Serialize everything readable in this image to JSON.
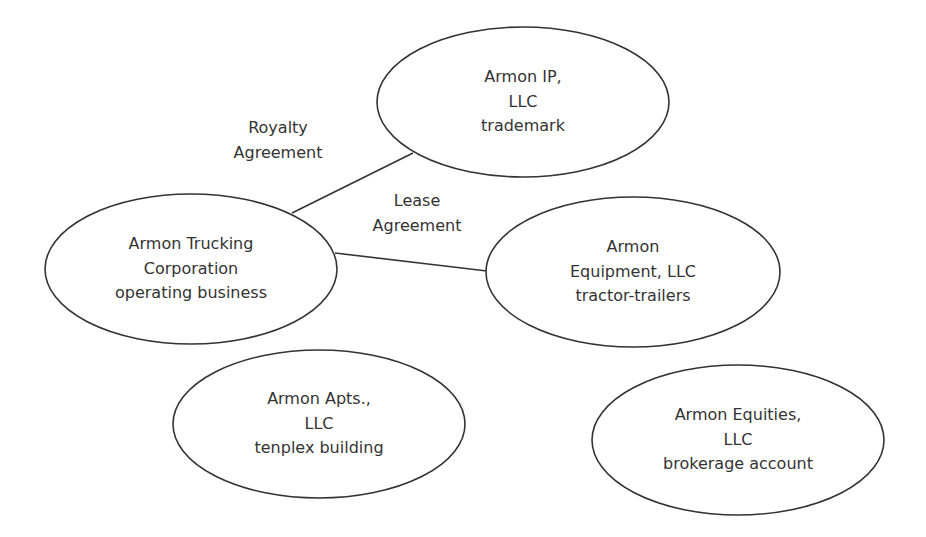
{
  "diagram": {
    "stroke_color": "#333333",
    "text_color": "#333333",
    "background": "#ffffff",
    "nodes": [
      {
        "id": "ip",
        "lines": [
          "Armon IP,",
          "LLC",
          "trademark"
        ],
        "cx": 523,
        "cy": 102,
        "rx": 146,
        "ry": 75
      },
      {
        "id": "trucking",
        "lines": [
          "Armon Trucking",
          "Corporation",
          "operating business"
        ],
        "cx": 191,
        "cy": 269,
        "rx": 146,
        "ry": 75
      },
      {
        "id": "equipment",
        "lines": [
          "Armon",
          "Equipment, LLC",
          "tractor-trailers"
        ],
        "cx": 633,
        "cy": 272,
        "rx": 147,
        "ry": 75
      },
      {
        "id": "apts",
        "lines": [
          "Armon Apts.,",
          "LLC",
          "tenplex building"
        ],
        "cx": 319,
        "cy": 424,
        "rx": 146,
        "ry": 74
      },
      {
        "id": "equities",
        "lines": [
          "Armon Equities,",
          "LLC",
          "brokerage account"
        ],
        "cx": 738,
        "cy": 440,
        "rx": 146,
        "ry": 75
      }
    ],
    "edges": [
      {
        "id": "royalty",
        "from": "trucking",
        "to": "ip",
        "label_lines": [
          "Royalty",
          "Agreement"
        ],
        "x1": 292,
        "y1": 213,
        "x2": 413,
        "y2": 153
      },
      {
        "id": "lease",
        "from": "trucking",
        "to": "equipment",
        "label_lines": [
          "Lease",
          "Agreement"
        ],
        "x1": 335,
        "y1": 253,
        "x2": 487,
        "y2": 271
      }
    ]
  }
}
